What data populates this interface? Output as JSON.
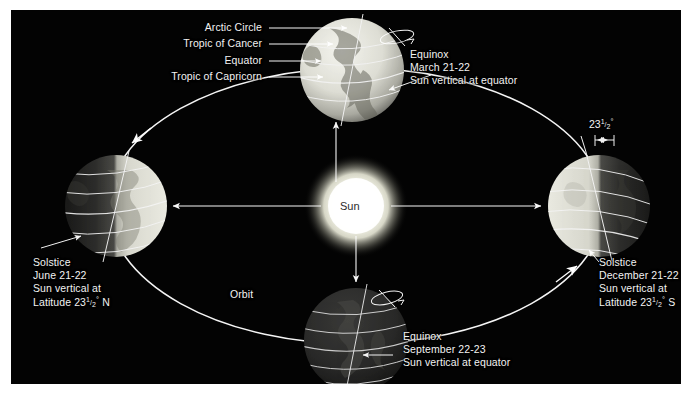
{
  "figure": {
    "background_color": "#030303",
    "mat_color": "#ffffff",
    "line_color": "#ffffff",
    "text_color": "#f2f2f2"
  },
  "center_body": {
    "name": "Sun",
    "label": "Sun",
    "label_color": "#2b2b2b",
    "glow_color": "#fdfdf6"
  },
  "orbit": {
    "label": "Orbit",
    "shape": "ellipse",
    "direction": "counterclockwise"
  },
  "axis_tilt": {
    "value": "23",
    "fraction_num": "1",
    "fraction_den": "2",
    "degree_symbol": "°",
    "full_text": "23 1/2°"
  },
  "callouts": [
    {
      "label": "Arctic Circle"
    },
    {
      "label": "Tropic of Cancer"
    },
    {
      "label": "Equator"
    },
    {
      "label": "Tropic of Capricorn"
    }
  ],
  "positions": [
    {
      "id": "march-equinox",
      "lines": [
        "Equinox",
        "March 21-22",
        "Sun vertical at equator"
      ],
      "line1": "Equinox",
      "line2": "March 21-22",
      "line3": "Sun vertical at equator",
      "globe": "top",
      "illumination": "full-face-lit"
    },
    {
      "id": "june-solstice",
      "lines": [
        "Solstice",
        "June 21-22",
        "Sun vertical at",
        "Latitude 23 1/2° N"
      ],
      "line1": "Solstice",
      "line2": "June 21-22",
      "line3": "Sun vertical at",
      "line4_prefix": "Latitude 23",
      "line4_num": "1",
      "line4_den": "2",
      "line4_suffix": " N",
      "globe": "left",
      "illumination": "right-half-lit"
    },
    {
      "id": "december-solstice",
      "lines": [
        "Solstice",
        "December 21-22",
        "Sun vertical at",
        "Latitude 23 1/2° S"
      ],
      "line1": "Solstice",
      "line2": "December 21-22",
      "line3": "Sun vertical at",
      "line4_prefix": "Latitude 23",
      "line4_num": "1",
      "line4_den": "2",
      "line4_suffix": " S",
      "globe": "right",
      "illumination": "left-half-lit"
    },
    {
      "id": "september-equinox",
      "lines": [
        "Equinox",
        "September 22-23",
        "Sun vertical at equator"
      ],
      "line1": "Equinox",
      "line2": "September 22-23",
      "line3": "Sun vertical at equator",
      "globe": "bottom",
      "illumination": "far-side-lit"
    }
  ]
}
